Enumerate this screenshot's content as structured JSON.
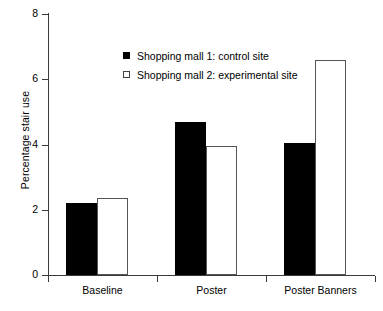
{
  "chart_data": {
    "type": "bar",
    "title": "",
    "xlabel": "",
    "ylabel": "Percentage stair use",
    "categories": [
      "Baseline",
      "Poster",
      "Poster Banners"
    ],
    "series": [
      {
        "name": "Shopping mall 1: control site",
        "color": "#000000",
        "style": "filled-black",
        "values": [
          2.2,
          4.7,
          4.05
        ]
      },
      {
        "name": "Shopping mall 2: experimental site",
        "color": "#ffffff",
        "style": "open-white",
        "values": [
          2.35,
          3.95,
          6.6
        ]
      }
    ],
    "ylim": [
      0,
      8
    ],
    "yticks": [
      0,
      2,
      4,
      6,
      8
    ],
    "ytick_labels": [
      "0",
      "2",
      "4",
      "6",
      "8"
    ],
    "grid": false,
    "legend_position": "upper-center",
    "axis_color": "#3a3a3a",
    "background": "#ffffff"
  },
  "legend": {
    "entries": [
      {
        "label": "Shopping mall 1: control site",
        "swatch": "filled-square-black"
      },
      {
        "label": "Shopping mall 2: experimental site",
        "swatch": "open-square-white"
      }
    ]
  }
}
